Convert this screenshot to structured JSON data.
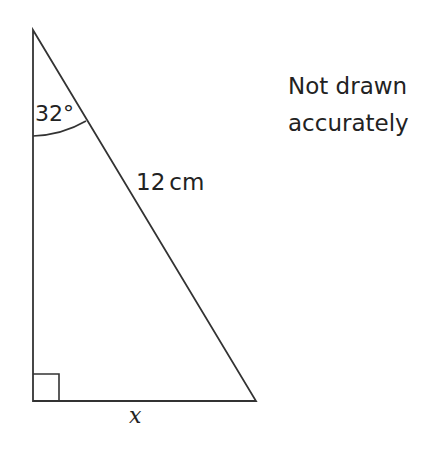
{
  "diagram": {
    "type": "right-triangle",
    "angle_label": "32°",
    "hypotenuse_label": "12",
    "hypotenuse_unit": "cm",
    "base_label": "x",
    "right_angle_marker": true,
    "note_line1": "Not drawn",
    "note_line2": "accurately",
    "colors": {
      "stroke": "#333333",
      "text": "#222222",
      "background": "#ffffff"
    }
  }
}
